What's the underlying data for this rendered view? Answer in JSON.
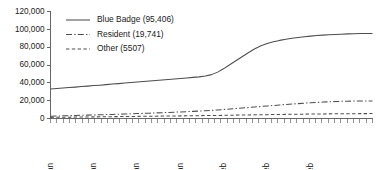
{
  "chart_data": {
    "type": "line",
    "title": "",
    "xlabel": "",
    "ylabel": "",
    "ylim": [
      0,
      120000
    ],
    "grid": false,
    "legend_position": "top-center",
    "ytick_labels": [
      "0",
      "20,000",
      "40,000",
      "60,000",
      "80,000",
      "100,000",
      "120,000"
    ],
    "ytick_values": [
      0,
      20000,
      40000,
      60000,
      80000,
      100000,
      120000
    ],
    "xtick_labels": [
      "06 Jan",
      "13 Jan",
      "20 Jan",
      "27 Jan",
      "03 Feb",
      "10 Feb",
      "17 Feb"
    ],
    "xtick_indices": [
      0,
      7,
      14,
      21,
      28,
      35,
      42
    ],
    "x_minor_tick_count": 52,
    "series": [
      {
        "name": "Blue Badge",
        "legend_label": "Blue Badge (95,406)",
        "total": 95406,
        "style": "solid",
        "values": [
          33000,
          33600,
          34100,
          34700,
          35200,
          35800,
          36300,
          36900,
          37400,
          38000,
          38600,
          39100,
          39700,
          40300,
          40900,
          41400,
          42000,
          42600,
          43200,
          43700,
          44300,
          44900,
          45500,
          46100,
          46700,
          47600,
          49200,
          52000,
          56000,
          60500,
          65000,
          69500,
          74000,
          78200,
          81500,
          84000,
          86000,
          87600,
          88900,
          90000,
          90900,
          91700,
          92400,
          93000,
          93500,
          93900,
          94300,
          94600,
          94900,
          95100,
          95250,
          95350,
          95406
        ]
      },
      {
        "name": "Resident",
        "legend_label": "Resident (19,741)",
        "total": 19741,
        "style": "dashdot",
        "values": [
          2600,
          2800,
          3000,
          3200,
          3400,
          3600,
          3800,
          4000,
          4200,
          4400,
          4600,
          4800,
          5000,
          5250,
          5500,
          5750,
          6000,
          6250,
          6500,
          6800,
          7100,
          7400,
          7700,
          8000,
          8300,
          8700,
          9100,
          9600,
          10100,
          10650,
          11200,
          11750,
          12300,
          12900,
          13500,
          14050,
          14600,
          15150,
          15700,
          16200,
          16700,
          17150,
          17600,
          18000,
          18400,
          18750,
          19000,
          19250,
          19420,
          19560,
          19660,
          19710,
          19741
        ]
      },
      {
        "name": "Other",
        "legend_label": "Other (5507)",
        "total": 5507,
        "style": "dashed",
        "values": [
          1250,
          1330,
          1410,
          1490,
          1570,
          1650,
          1730,
          1810,
          1890,
          1970,
          2050,
          2130,
          2210,
          2290,
          2370,
          2450,
          2530,
          2610,
          2690,
          2770,
          2850,
          2930,
          3010,
          3090,
          3170,
          3260,
          3350,
          3450,
          3560,
          3670,
          3780,
          3890,
          4000,
          4110,
          4220,
          4320,
          4420,
          4520,
          4620,
          4710,
          4800,
          4890,
          4970,
          5050,
          5120,
          5190,
          5250,
          5310,
          5360,
          5410,
          5450,
          5485,
          5507
        ]
      }
    ]
  }
}
